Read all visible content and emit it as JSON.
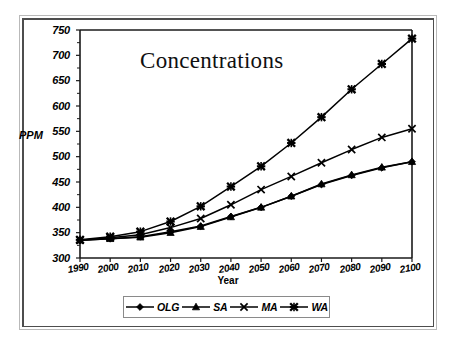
{
  "frame": {
    "outer_border_color": "#b9b9b9",
    "inner_border_color": "#4d4d4d",
    "background": "#ffffff"
  },
  "chart_data": {
    "type": "line",
    "title": "Concentrations",
    "xlabel": "Year",
    "ylabel": "PPM",
    "grid": false,
    "legend_position": "bottom",
    "xlim": [
      1990,
      2100
    ],
    "ylim": [
      300,
      750
    ],
    "ytick_step": 50,
    "xtick_step": 10,
    "categories": [
      1990,
      2000,
      2010,
      2020,
      2030,
      2040,
      2050,
      2060,
      2070,
      2080,
      2090,
      2100
    ],
    "xticklabels": [
      "1990",
      "2000",
      "2010",
      "2020",
      "2030",
      "2040",
      "2050",
      "2060",
      "2070",
      "2080",
      "2090",
      "2100"
    ],
    "yticklabels": [
      "300",
      "350",
      "400",
      "450",
      "500",
      "550",
      "600",
      "650",
      "700",
      "750"
    ],
    "series": [
      {
        "name": "OLG",
        "marker": "diamond",
        "color": "#000000",
        "values": [
          335,
          338,
          342,
          352,
          363,
          382,
          400,
          422,
          445,
          463,
          478,
          490
        ]
      },
      {
        "name": "SA",
        "marker": "triangle",
        "color": "#000000",
        "values": [
          335,
          338,
          341,
          350,
          362,
          381,
          400,
          422,
          446,
          464,
          479,
          490
        ]
      },
      {
        "name": "MA",
        "marker": "x",
        "color": "#000000",
        "values": [
          335,
          340,
          346,
          360,
          378,
          405,
          435,
          461,
          488,
          514,
          538,
          555
        ]
      },
      {
        "name": "WA",
        "marker": "star",
        "color": "#000000",
        "values": [
          336,
          342,
          352,
          372,
          402,
          441,
          481,
          527,
          578,
          633,
          683,
          733
        ]
      }
    ]
  },
  "legend": {
    "entries": [
      {
        "label": "OLG",
        "marker": "diamond"
      },
      {
        "label": "SA",
        "marker": "triangle"
      },
      {
        "label": "MA",
        "marker": "x"
      },
      {
        "label": "WA",
        "marker": "star"
      }
    ]
  }
}
